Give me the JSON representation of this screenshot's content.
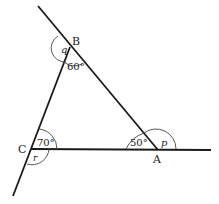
{
  "diagram": {
    "type": "geometry-triangle",
    "vertices": {
      "A": {
        "label": "A"
      },
      "B": {
        "label": "B"
      },
      "C": {
        "label": "C"
      }
    },
    "angles": {
      "B_interior": "60°",
      "C_interior": "70°",
      "A_interior": "50°",
      "B_exterior": "q",
      "C_exterior": "r",
      "A_exterior": "p"
    },
    "colors": {
      "line": "#1a1a1a",
      "background": "#ffffff"
    }
  }
}
